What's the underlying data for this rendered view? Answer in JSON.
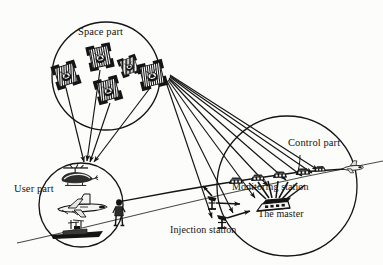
{
  "figure": {
    "type": "diagram",
    "background_color": "#fcfcfb",
    "ink_color": "#141414"
  },
  "labels": {
    "space_part": "Space part",
    "user_part": "User part",
    "control_part": "Control part",
    "monitoring_station": "Monitoring station",
    "the_master": "The master",
    "injection_station": "Injection station"
  },
  "segments": [
    {
      "id": "space",
      "label": "Space part",
      "shape": "circle",
      "center": [
        106,
        76
      ],
      "radius": 54,
      "contents": "satellite-constellation",
      "satellite_count": 5
    },
    {
      "id": "user",
      "label": "User part",
      "shape": "circle",
      "center": [
        81,
        205
      ],
      "radius": 42,
      "contents": "helicopter, airplane, ship, person",
      "vehicle_count": 4
    },
    {
      "id": "control",
      "label": "Control part",
      "shape": "circle",
      "center": [
        287,
        186
      ],
      "radius": 70,
      "contents": "monitoring stations, master control, injection station",
      "monitoring_station_count": 4
    }
  ],
  "links": {
    "downlink_to_user_count": 4,
    "downlink_to_control_count": 8,
    "master_fan_count": 7,
    "injection_arrow_count": 3
  },
  "horizon": {
    "name": "earth-surface-line",
    "from": [
      17,
      243
    ],
    "to": [
      383,
      162
    ]
  },
  "aircraft_marker": {
    "name": "far-aircraft",
    "position": [
      352,
      168
    ]
  },
  "icons": {
    "satellite": "satellite-icon",
    "helicopter": "helicopter-icon",
    "airplane": "airplane-icon",
    "ship": "ship-icon",
    "person": "person-icon",
    "station": "station-building-icon",
    "antenna": "antenna-dish-icon",
    "master": "master-control-icon"
  }
}
